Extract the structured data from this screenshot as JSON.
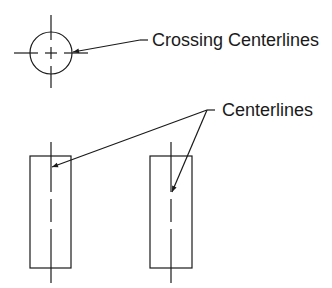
{
  "diagram": {
    "labels": {
      "crossing": "Crossing Centerlines",
      "centerlines": "Centerlines"
    },
    "colors": {
      "line": "#1a1a1a",
      "background": "#ffffff"
    },
    "shapes": {
      "circle": {
        "cx": 51,
        "cy": 53,
        "r": 21
      },
      "left_rect": {
        "x": 30,
        "y": 156,
        "w": 41,
        "h": 112
      },
      "right_rect": {
        "x": 150,
        "y": 156,
        "w": 42,
        "h": 112
      }
    }
  }
}
